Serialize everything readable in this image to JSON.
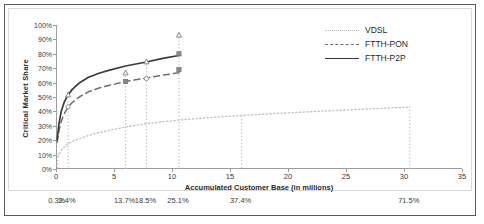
{
  "chart_data": {
    "type": "line",
    "title": "",
    "xlabel": "Accumulated Customer Base (in millions)",
    "ylabel": "Critical Market Share",
    "xlim": [
      0,
      35
    ],
    "ylim": [
      0,
      1.0
    ],
    "grid": false,
    "legend_position": "top-right",
    "x_ticks": [
      0,
      5,
      10,
      15,
      20,
      25,
      30,
      35
    ],
    "x_tick_labels": [
      "0",
      "5",
      "10",
      "15",
      "20",
      "25",
      "30",
      "35"
    ],
    "y_ticks": [
      0,
      0.1,
      0.2,
      0.3,
      0.4,
      0.5,
      0.6,
      0.7,
      0.8,
      0.9,
      1.0
    ],
    "y_tick_labels": [
      "0%",
      "10%",
      "20%",
      "30%",
      "40%",
      "50%",
      "60%",
      "70%",
      "80%",
      "90%",
      "100%"
    ],
    "series": [
      {
        "name": "VDSL",
        "style": "dotted",
        "color": "#c4c4c4",
        "x": [
          0.15,
          0.5,
          1.0,
          1.6,
          2.4,
          3.4,
          4.6,
          6.0,
          7.8,
          9.2,
          10.6,
          13.0,
          16.0,
          19.0,
          22.0,
          25.0,
          28.0,
          30.5
        ],
        "y": [
          0.085,
          0.135,
          0.175,
          0.198,
          0.222,
          0.247,
          0.268,
          0.292,
          0.315,
          0.328,
          0.34,
          0.356,
          0.372,
          0.386,
          0.398,
          0.41,
          0.421,
          0.43
        ]
      },
      {
        "name": "FTTH-PON",
        "style": "dashed",
        "color": "#6e6e6e",
        "x": [
          0.1,
          0.25,
          0.45,
          0.7,
          1.0,
          1.4,
          2.0,
          2.8,
          3.7,
          4.7,
          6.0,
          7.0,
          7.8,
          9.2,
          10.6
        ],
        "y": [
          0.185,
          0.265,
          0.33,
          0.382,
          0.425,
          0.462,
          0.5,
          0.536,
          0.562,
          0.583,
          0.608,
          0.622,
          0.632,
          0.652,
          0.668
        ]
      },
      {
        "name": "FTTH-P2P",
        "style": "solid",
        "color": "#3a3a3a",
        "x": [
          0.1,
          0.25,
          0.45,
          0.7,
          1.0,
          1.4,
          2.0,
          2.8,
          3.7,
          4.7,
          6.0,
          7.0,
          7.8,
          9.2,
          10.6
        ],
        "y": [
          0.205,
          0.31,
          0.4,
          0.462,
          0.51,
          0.553,
          0.597,
          0.637,
          0.665,
          0.688,
          0.715,
          0.731,
          0.743,
          0.768,
          0.788
        ]
      }
    ],
    "markers": [
      {
        "series": "FTTH-PON",
        "x": 1.05,
        "y": 0.432,
        "shape": "circle"
      },
      {
        "series": "FTTH-P2P",
        "x": 1.05,
        "y": 0.515,
        "shape": "triangle"
      },
      {
        "series": "FTTH-PON",
        "x": 6.0,
        "y": 0.608,
        "shape": "square"
      },
      {
        "series": "FTTH-P2P",
        "x": 6.0,
        "y": 0.668,
        "shape": "triangle"
      },
      {
        "series": "FTTH-PON",
        "x": 7.8,
        "y": 0.628,
        "shape": "circle"
      },
      {
        "series": "FTTH-P2P",
        "x": 7.8,
        "y": 0.745,
        "shape": "triangle"
      },
      {
        "series": "FTTH-PON",
        "x": 10.6,
        "y": 0.69,
        "shape": "square"
      },
      {
        "series": "FTTH-P2P",
        "x": 10.6,
        "y": 0.8,
        "shape": "square"
      },
      {
        "series": "FTTH-P2P",
        "x": 10.6,
        "y": 0.93,
        "shape": "triangle"
      }
    ],
    "vertical_reference_lines": [
      {
        "x": 0.15,
        "label": "0.3%",
        "top": 0.11
      },
      {
        "x": 1.05,
        "label": "2.4%",
        "top": 0.47
      },
      {
        "x": 6.0,
        "label": "13.7%",
        "top": 0.67
      },
      {
        "x": 7.8,
        "label": "18.5%",
        "top": 0.75
      },
      {
        "x": 10.6,
        "label": "25.1%",
        "top": 0.94
      },
      {
        "x": 16.0,
        "label": "37.4%",
        "top": 0.37
      },
      {
        "x": 30.5,
        "label": "71.5%",
        "top": 0.435
      }
    ]
  },
  "legend": {
    "entries": [
      {
        "label": "VDSL"
      },
      {
        "label": "FTTH-PON"
      },
      {
        "label": "FTTH-P2P"
      }
    ]
  },
  "colors": {
    "vdsl": "#c4c4c4",
    "ftth_pon": "#6e6e6e",
    "ftth_p2p": "#3a3a3a",
    "axis": "#9d9d9d",
    "text": "#3a3a3a",
    "border": "#5a5a5a"
  },
  "corner_mark": ""
}
